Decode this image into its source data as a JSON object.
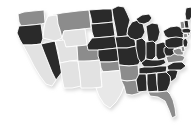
{
  "map": {
    "title": "United States choropleth map",
    "type": "choropleth",
    "projection": "albers-usa",
    "background_color": "#ffffff",
    "border_color": "#ffffff",
    "shadow_color": "#f0f0f0",
    "scale": {
      "kind": "grayscale-3-step",
      "bins": [
        {
          "name": "dark",
          "color": "#2b2b2b"
        },
        {
          "name": "medium",
          "color": "#8c8c8c"
        },
        {
          "name": "light",
          "color": "#e2e2e2"
        }
      ]
    },
    "states": [
      {
        "code": "WA",
        "name": "Washington",
        "bin": "medium",
        "color": "#8c8c8c"
      },
      {
        "code": "OR",
        "name": "Oregon",
        "bin": "dark",
        "color": "#2b2b2b"
      },
      {
        "code": "CA",
        "name": "California",
        "bin": "light",
        "color": "#e2e2e2"
      },
      {
        "code": "NV",
        "name": "Nevada",
        "bin": "dark",
        "color": "#2b2b2b"
      },
      {
        "code": "ID",
        "name": "Idaho",
        "bin": "light",
        "color": "#e2e2e2"
      },
      {
        "code": "MT",
        "name": "Montana",
        "bin": "medium",
        "color": "#8c8c8c"
      },
      {
        "code": "WY",
        "name": "Wyoming",
        "bin": "light",
        "color": "#e2e2e2"
      },
      {
        "code": "UT",
        "name": "Utah",
        "bin": "light",
        "color": "#e2e2e2"
      },
      {
        "code": "AZ",
        "name": "Arizona",
        "bin": "light",
        "color": "#e2e2e2"
      },
      {
        "code": "CO",
        "name": "Colorado",
        "bin": "medium",
        "color": "#8c8c8c"
      },
      {
        "code": "NM",
        "name": "New Mexico",
        "bin": "light",
        "color": "#e2e2e2"
      },
      {
        "code": "ND",
        "name": "North Dakota",
        "bin": "dark",
        "color": "#2b2b2b"
      },
      {
        "code": "SD",
        "name": "South Dakota",
        "bin": "dark",
        "color": "#2b2b2b"
      },
      {
        "code": "NE",
        "name": "Nebraska",
        "bin": "dark",
        "color": "#2b2b2b"
      },
      {
        "code": "KS",
        "name": "Kansas",
        "bin": "dark",
        "color": "#2b2b2b"
      },
      {
        "code": "OK",
        "name": "Oklahoma",
        "bin": "medium",
        "color": "#8c8c8c"
      },
      {
        "code": "TX",
        "name": "Texas",
        "bin": "light",
        "color": "#e8e8e8"
      },
      {
        "code": "MN",
        "name": "Minnesota",
        "bin": "dark",
        "color": "#2b2b2b"
      },
      {
        "code": "IA",
        "name": "Iowa",
        "bin": "dark",
        "color": "#2b2b2b"
      },
      {
        "code": "MO",
        "name": "Missouri",
        "bin": "dark",
        "color": "#2b2b2b"
      },
      {
        "code": "AR",
        "name": "Arkansas",
        "bin": "medium",
        "color": "#8c8c8c"
      },
      {
        "code": "LA",
        "name": "Louisiana",
        "bin": "medium",
        "color": "#8c8c8c"
      },
      {
        "code": "WI",
        "name": "Wisconsin",
        "bin": "dark",
        "color": "#2b2b2b"
      },
      {
        "code": "IL",
        "name": "Illinois",
        "bin": "dark",
        "color": "#2b2b2b"
      },
      {
        "code": "MI",
        "name": "Michigan",
        "bin": "dark",
        "color": "#2b2b2b"
      },
      {
        "code": "IN",
        "name": "Indiana",
        "bin": "dark",
        "color": "#2b2b2b"
      },
      {
        "code": "OH",
        "name": "Ohio",
        "bin": "dark",
        "color": "#2b2b2b"
      },
      {
        "code": "KY",
        "name": "Kentucky",
        "bin": "dark",
        "color": "#2b2b2b"
      },
      {
        "code": "TN",
        "name": "Tennessee",
        "bin": "dark",
        "color": "#2b2b2b"
      },
      {
        "code": "MS",
        "name": "Mississippi",
        "bin": "dark",
        "color": "#2b2b2b"
      },
      {
        "code": "AL",
        "name": "Alabama",
        "bin": "dark",
        "color": "#2b2b2b"
      },
      {
        "code": "GA",
        "name": "Georgia",
        "bin": "dark",
        "color": "#2b2b2b"
      },
      {
        "code": "FL",
        "name": "Florida",
        "bin": "medium",
        "color": "#8c8c8c"
      },
      {
        "code": "SC",
        "name": "South Carolina",
        "bin": "dark",
        "color": "#2b2b2b"
      },
      {
        "code": "NC",
        "name": "North Carolina",
        "bin": "dark",
        "color": "#2b2b2b"
      },
      {
        "code": "VA",
        "name": "Virginia",
        "bin": "medium",
        "color": "#8c8c8c"
      },
      {
        "code": "WV",
        "name": "West Virginia",
        "bin": "dark",
        "color": "#2b2b2b"
      },
      {
        "code": "MD",
        "name": "Maryland",
        "bin": "medium",
        "color": "#8c8c8c"
      },
      {
        "code": "DE",
        "name": "Delaware",
        "bin": "medium",
        "color": "#8c8c8c"
      },
      {
        "code": "PA",
        "name": "Pennsylvania",
        "bin": "dark",
        "color": "#2b2b2b"
      },
      {
        "code": "NJ",
        "name": "New Jersey",
        "bin": "dark",
        "color": "#2b2b2b"
      },
      {
        "code": "NY",
        "name": "New York",
        "bin": "dark",
        "color": "#2b2b2b"
      },
      {
        "code": "CT",
        "name": "Connecticut",
        "bin": "medium",
        "color": "#8c8c8c"
      },
      {
        "code": "RI",
        "name": "Rhode Island",
        "bin": "medium",
        "color": "#8c8c8c"
      },
      {
        "code": "MA",
        "name": "Massachusetts",
        "bin": "dark",
        "color": "#2b2b2b"
      },
      {
        "code": "VT",
        "name": "Vermont",
        "bin": "medium",
        "color": "#8c8c8c"
      },
      {
        "code": "NH",
        "name": "New Hampshire",
        "bin": "dark",
        "color": "#2b2b2b"
      },
      {
        "code": "ME",
        "name": "Maine",
        "bin": "dark",
        "color": "#2b2b2b"
      }
    ]
  }
}
